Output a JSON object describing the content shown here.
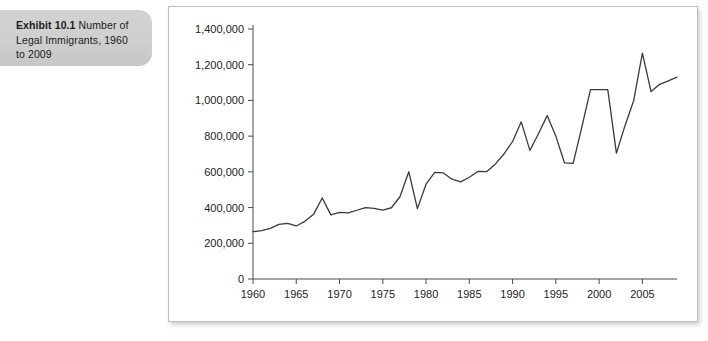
{
  "caption": {
    "label": "Exhibit 10.1",
    "text": " Number of Legal Immigrants, 1960 to 2009",
    "full": "Exhibit 10.1 Number of Legal Immigrants, 1960 to 2009"
  },
  "colors": {
    "caption_background": "#cfcfcf",
    "panel_background": "#ffffff",
    "panel_border": "#bdbdbd",
    "line": "#3a3a3a",
    "axis": "#4a4a4a",
    "text": "#1c1c1c"
  },
  "chart_data": {
    "type": "line",
    "title": "",
    "xlabel": "",
    "ylabel": "",
    "grid": false,
    "legend": "none",
    "xlim": [
      1960,
      2009
    ],
    "ylim": [
      0,
      1400000
    ],
    "x_ticks": [
      1960,
      1965,
      1970,
      1975,
      1980,
      1985,
      1990,
      1995,
      2000,
      2005
    ],
    "x_tick_labels": [
      "1960",
      "1965",
      "1970",
      "1975",
      "1980",
      "1985",
      "1990",
      "1995",
      "2000",
      "2005"
    ],
    "y_ticks": [
      0,
      200000,
      400000,
      600000,
      800000,
      1000000,
      1200000,
      1400000
    ],
    "y_tick_labels": [
      "0",
      "200,000",
      "400,000",
      "600,000",
      "800,000",
      "1,000,000",
      "1,200,000",
      "1,400,000"
    ],
    "x": [
      1960,
      1961,
      1962,
      1963,
      1964,
      1965,
      1966,
      1967,
      1968,
      1969,
      1970,
      1971,
      1972,
      1973,
      1974,
      1975,
      1976,
      1977,
      1978,
      1979,
      1980,
      1981,
      1982,
      1983,
      1984,
      1985,
      1986,
      1987,
      1988,
      1989,
      1990,
      1991,
      1992,
      1993,
      1994,
      1995,
      1996,
      1997,
      1998,
      1999,
      2000,
      2001,
      2002,
      2003,
      2004,
      2005,
      2006,
      2007,
      2008,
      2009
    ],
    "series": [
      {
        "name": "Number of Legal Immigrants",
        "values": [
          265000,
          271000,
          284000,
          306000,
          312000,
          297000,
          323000,
          362000,
          454000,
          359000,
          373000,
          370000,
          385000,
          400000,
          395000,
          386000,
          399000,
          462000,
          601000,
          394000,
          531000,
          597000,
          594000,
          559000,
          544000,
          570000,
          602000,
          601000,
          643000,
          1090000,
          1536000,
          1827000,
          974000,
          904000,
          804000,
          720000,
          916000,
          798000,
          654000,
          647000,
          850000,
          1064000,
          1059000,
          704000,
          958000,
          1122000,
          1266000,
          1052000,
          1107000,
          1130000
        ],
        "plot_values": [
          265000,
          271000,
          284000,
          306000,
          312000,
          297000,
          323000,
          362000,
          454000,
          359000,
          373000,
          370000,
          385000,
          400000,
          395000,
          386000,
          399000,
          462000,
          601000,
          394000,
          531000,
          597000,
          594000,
          559000,
          544000,
          570000,
          602000,
          601000,
          643000,
          700000,
          770000,
          880000,
          720000,
          815000,
          915000,
          800000,
          650000,
          647000,
          850000,
          1060000,
          1060000,
          1060000,
          705000,
          860000,
          1000000,
          1265000,
          1050000,
          1090000,
          1110000,
          1130000
        ]
      }
    ]
  }
}
